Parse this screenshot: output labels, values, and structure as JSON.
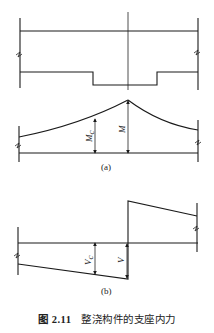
{
  "figure": {
    "number": "图 2.11",
    "title": "整浇构件的支座内力",
    "subfigures": [
      {
        "id": "a",
        "label": "(a)",
        "description": "Bending moment diagram near support",
        "annotations": [
          "Mc",
          "M"
        ]
      },
      {
        "id": "b",
        "label": "(b)",
        "description": "Shear force diagram near support",
        "annotations": [
          "Vc",
          "V"
        ]
      }
    ]
  },
  "labels": {
    "moment_c_main": "M",
    "moment_c_sub": "c",
    "moment": "M",
    "shear_c_main": "V",
    "shear_c_sub": "c",
    "shear": "V",
    "sub_a": "(a)",
    "sub_b": "(b)"
  }
}
